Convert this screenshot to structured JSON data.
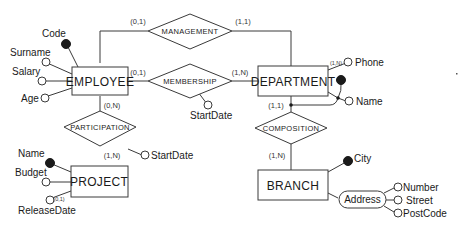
{
  "entities": {
    "employee": {
      "label": "EMPLOYEE"
    },
    "department": {
      "label": "DEPARTMENT"
    },
    "project": {
      "label": "PROJECT"
    },
    "branch": {
      "label": "BRANCH"
    }
  },
  "relationships": {
    "management": {
      "label": "MANAGEMENT"
    },
    "membership": {
      "label": "MEMBERSHIP"
    },
    "participation": {
      "label": "PARTICIPATION"
    },
    "composition": {
      "label": "COMPOSITION"
    }
  },
  "attributes": {
    "employee_code": "Code",
    "employee_surname": "Surname",
    "employee_salary": "Salary",
    "employee_age": "Age",
    "membership_startdate": "StartDate",
    "participation_startdate": "StartDate",
    "department_phone": "Phone",
    "department_name": "Name",
    "project_name": "Name",
    "project_budget": "Budget",
    "project_releasedate": "ReleaseDate",
    "branch_city": "City",
    "branch_address": "Address",
    "address_number": "Number",
    "address_street": "Street",
    "address_postcode": "PostCode"
  },
  "cardinalities": {
    "employee_management": "(0,1)",
    "department_management": "(1,1)",
    "employee_membership": "(0,1)",
    "department_membership": "(1,N)",
    "employee_participation": "(0,N)",
    "project_participation": "(1,N)",
    "department_composition": "(1,1)",
    "branch_composition": "(1,N)",
    "department_phone": "(1,N)",
    "project_releasedate": "(0,1)"
  },
  "colors": {
    "line": "#3a3a3a",
    "key_fill": "#1a1a1a",
    "background": "#ffffff"
  }
}
